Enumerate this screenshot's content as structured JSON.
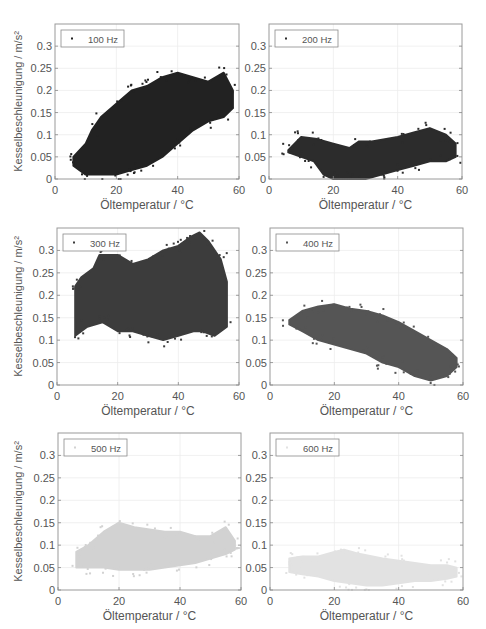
{
  "chart_data": [
    {
      "type": "scatter",
      "title": "",
      "legend": "100 Hz",
      "color": "#222222",
      "xlabel": "Öltemperatur / °C",
      "ylabel": "Kesselbeschleunigung / m/s²",
      "xlim": [
        0,
        60
      ],
      "ylim": [
        0,
        0.35
      ],
      "xticks": [
        0,
        20,
        40,
        60
      ],
      "yticks": [
        0,
        0.05,
        0.1,
        0.15,
        0.2,
        0.25,
        0.3
      ],
      "envelope_upper": [
        [
          6,
          0.05
        ],
        [
          10,
          0.08
        ],
        [
          12,
          0.11
        ],
        [
          15,
          0.14
        ],
        [
          20,
          0.17
        ],
        [
          25,
          0.2
        ],
        [
          30,
          0.21
        ],
        [
          35,
          0.23
        ],
        [
          40,
          0.24
        ],
        [
          45,
          0.23
        ],
        [
          50,
          0.22
        ],
        [
          55,
          0.24
        ],
        [
          58,
          0.2
        ]
      ],
      "envelope_lower": [
        [
          58,
          0.16
        ],
        [
          55,
          0.14
        ],
        [
          50,
          0.13
        ],
        [
          45,
          0.11
        ],
        [
          40,
          0.08
        ],
        [
          35,
          0.05
        ],
        [
          30,
          0.03
        ],
        [
          25,
          0.02
        ],
        [
          20,
          0.01
        ],
        [
          15,
          0.01
        ],
        [
          10,
          0.01
        ],
        [
          6,
          0.03
        ]
      ]
    },
    {
      "type": "scatter",
      "legend": "200 Hz",
      "color": "#2c2c2c",
      "xlabel": "Öltemperatur / °C",
      "ylabel": "",
      "xlim": [
        0,
        60
      ],
      "ylim": [
        0,
        0.35
      ],
      "xticks": [
        0,
        20,
        40,
        60
      ],
      "yticks": [
        0,
        0.05,
        0.1,
        0.15,
        0.2,
        0.25,
        0.3
      ],
      "envelope_upper": [
        [
          6,
          0.065
        ],
        [
          10,
          0.095
        ],
        [
          15,
          0.09
        ],
        [
          20,
          0.08
        ],
        [
          25,
          0.07
        ],
        [
          28,
          0.085
        ],
        [
          32,
          0.085
        ],
        [
          40,
          0.095
        ],
        [
          45,
          0.105
        ],
        [
          50,
          0.115
        ],
        [
          55,
          0.1
        ],
        [
          58,
          0.08
        ]
      ],
      "envelope_lower": [
        [
          58,
          0.05
        ],
        [
          55,
          0.04
        ],
        [
          50,
          0.04
        ],
        [
          45,
          0.03
        ],
        [
          40,
          0.02
        ],
        [
          35,
          0.01
        ],
        [
          30,
          0.0
        ],
        [
          25,
          0.0
        ],
        [
          20,
          0.0
        ],
        [
          17,
          0.01
        ],
        [
          14,
          0.04
        ],
        [
          10,
          0.05
        ],
        [
          6,
          0.06
        ]
      ]
    },
    {
      "type": "scatter",
      "legend": "300 Hz",
      "color": "#3c3c3c",
      "xlabel": "Öltemperatur / °C",
      "ylabel": "Kesselbeschleunigung / m/s²",
      "xlim": [
        0,
        60
      ],
      "ylim": [
        0,
        0.35
      ],
      "xticks": [
        0,
        20,
        40,
        60
      ],
      "yticks": [
        0,
        0.05,
        0.1,
        0.15,
        0.2,
        0.25,
        0.3
      ],
      "envelope_upper": [
        [
          6,
          0.22
        ],
        [
          8,
          0.24
        ],
        [
          12,
          0.26
        ],
        [
          14,
          0.29
        ],
        [
          20,
          0.29
        ],
        [
          25,
          0.27
        ],
        [
          30,
          0.28
        ],
        [
          35,
          0.3
        ],
        [
          40,
          0.31
        ],
        [
          44,
          0.33
        ],
        [
          47,
          0.34
        ],
        [
          50,
          0.32
        ],
        [
          54,
          0.28
        ],
        [
          56,
          0.23
        ]
      ],
      "envelope_lower": [
        [
          56,
          0.13
        ],
        [
          52,
          0.11
        ],
        [
          48,
          0.12
        ],
        [
          45,
          0.12
        ],
        [
          40,
          0.11
        ],
        [
          35,
          0.1
        ],
        [
          30,
          0.11
        ],
        [
          25,
          0.12
        ],
        [
          20,
          0.12
        ],
        [
          15,
          0.14
        ],
        [
          10,
          0.13
        ],
        [
          6,
          0.11
        ]
      ]
    },
    {
      "type": "scatter",
      "legend": "400 Hz",
      "color": "#555555",
      "xlabel": "Öltemperatur / °C",
      "ylabel": "",
      "xlim": [
        0,
        60
      ],
      "ylim": [
        0,
        0.35
      ],
      "xticks": [
        0,
        20,
        40,
        60
      ],
      "yticks": [
        0,
        0.05,
        0.1,
        0.15,
        0.2,
        0.25,
        0.3
      ],
      "envelope_upper": [
        [
          6,
          0.145
        ],
        [
          10,
          0.165
        ],
        [
          15,
          0.175
        ],
        [
          20,
          0.18
        ],
        [
          25,
          0.17
        ],
        [
          30,
          0.165
        ],
        [
          35,
          0.155
        ],
        [
          40,
          0.14
        ],
        [
          45,
          0.12
        ],
        [
          50,
          0.1
        ],
        [
          55,
          0.08
        ],
        [
          58,
          0.06
        ]
      ],
      "envelope_lower": [
        [
          58,
          0.04
        ],
        [
          55,
          0.02
        ],
        [
          50,
          0.01
        ],
        [
          45,
          0.02
        ],
        [
          40,
          0.04
        ],
        [
          35,
          0.05
        ],
        [
          30,
          0.07
        ],
        [
          25,
          0.08
        ],
        [
          20,
          0.09
        ],
        [
          15,
          0.1
        ],
        [
          10,
          0.12
        ],
        [
          6,
          0.135
        ]
      ]
    },
    {
      "type": "scatter",
      "legend": "500 Hz",
      "color": "#d2d2d2",
      "xlabel": "Öltemperatur / °C",
      "ylabel": "Kesselbeschleunigung / m/s²",
      "xlim": [
        0,
        60
      ],
      "ylim": [
        0,
        0.35
      ],
      "xticks": [
        0,
        20,
        40,
        60
      ],
      "yticks": [
        0,
        0.05,
        0.1,
        0.15,
        0.2,
        0.25,
        0.3
      ],
      "envelope_upper": [
        [
          6,
          0.085
        ],
        [
          10,
          0.1
        ],
        [
          15,
          0.13
        ],
        [
          20,
          0.15
        ],
        [
          25,
          0.14
        ],
        [
          30,
          0.135
        ],
        [
          35,
          0.13
        ],
        [
          40,
          0.13
        ],
        [
          45,
          0.12
        ],
        [
          50,
          0.12
        ],
        [
          55,
          0.14
        ],
        [
          58,
          0.11
        ]
      ],
      "envelope_lower": [
        [
          58,
          0.09
        ],
        [
          55,
          0.08
        ],
        [
          50,
          0.07
        ],
        [
          45,
          0.06
        ],
        [
          40,
          0.055
        ],
        [
          35,
          0.05
        ],
        [
          30,
          0.045
        ],
        [
          25,
          0.045
        ],
        [
          20,
          0.045
        ],
        [
          15,
          0.05
        ],
        [
          10,
          0.05
        ],
        [
          6,
          0.05
        ]
      ]
    },
    {
      "type": "scatter",
      "legend": "600 Hz",
      "color": "#e2e2e2",
      "xlabel": "Öltemperatur / °C",
      "ylabel": "",
      "xlim": [
        0,
        60
      ],
      "ylim": [
        0,
        0.35
      ],
      "xticks": [
        0,
        20,
        40,
        60
      ],
      "yticks": [
        0,
        0.05,
        0.1,
        0.15,
        0.2,
        0.25,
        0.3
      ],
      "envelope_upper": [
        [
          6,
          0.07
        ],
        [
          10,
          0.075
        ],
        [
          15,
          0.075
        ],
        [
          20,
          0.085
        ],
        [
          23,
          0.09
        ],
        [
          28,
          0.08
        ],
        [
          35,
          0.07
        ],
        [
          40,
          0.065
        ],
        [
          45,
          0.06
        ],
        [
          50,
          0.055
        ],
        [
          55,
          0.055
        ],
        [
          58,
          0.05
        ]
      ],
      "envelope_lower": [
        [
          58,
          0.03
        ],
        [
          55,
          0.025
        ],
        [
          50,
          0.02
        ],
        [
          45,
          0.02
        ],
        [
          40,
          0.015
        ],
        [
          35,
          0.01
        ],
        [
          30,
          0.01
        ],
        [
          25,
          0.015
        ],
        [
          20,
          0.02
        ],
        [
          15,
          0.03
        ],
        [
          10,
          0.035
        ],
        [
          6,
          0.04
        ]
      ]
    }
  ],
  "layout": {
    "panels": [
      {
        "left": 55,
        "top": 24,
        "width": 184,
        "height": 155
      },
      {
        "left": 269,
        "top": 24,
        "width": 193,
        "height": 155
      },
      {
        "left": 57,
        "top": 228,
        "width": 182,
        "height": 157
      },
      {
        "left": 270,
        "top": 228,
        "width": 193,
        "height": 157
      },
      {
        "left": 58,
        "top": 433,
        "width": 183,
        "height": 157
      },
      {
        "left": 270,
        "top": 433,
        "width": 193,
        "height": 157
      }
    ]
  }
}
